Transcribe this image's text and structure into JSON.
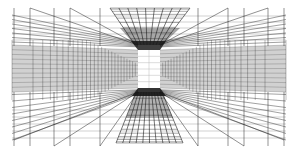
{
  "image": {
    "description": "Black and white perspective line drawing of a grid corridor with a bright rectangular opening at the vanishing point",
    "width": 298,
    "height": 152,
    "background": "#ffffff",
    "line_color": "#1a1a1a"
  },
  "perspective": {
    "vanishing_point": [
      149,
      69
    ],
    "inner_rect": {
      "x1": 138,
      "y1": 50,
      "x2": 160,
      "y2": 88
    },
    "ceiling_trapezoid": {
      "outer_y": 8,
      "outer_x1": 110,
      "outer_x2": 190,
      "inner_y": 45,
      "inner_x1": 135,
      "inner_x2": 162
    },
    "floor_trapezoid": {
      "outer_y": 143,
      "outer_x1": 116,
      "outer_x2": 183,
      "inner_y": 92,
      "inner_x1": 136,
      "inner_x2": 162
    },
    "side_walls": {
      "left_x": 12,
      "right_x": 286,
      "top_y": 15,
      "bottom_y": 140
    }
  }
}
